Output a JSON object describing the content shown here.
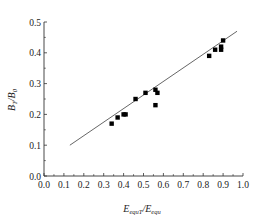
{
  "chart_data": {
    "type": "scatter",
    "title": "",
    "xlabel": "E_equT/E_equ",
    "ylabel": "B_T/B_0",
    "xlabel_parts": {
      "main": "E",
      "sub": "equT",
      "sep": "/",
      "main2": "E",
      "sub2": "equ"
    },
    "ylabel_parts": {
      "main": "B",
      "sub": "T",
      "sep": "/",
      "main2": "B",
      "sub2": "0"
    },
    "xlim": [
      0.0,
      1.0
    ],
    "ylim": [
      0.0,
      0.5
    ],
    "xticks": [
      "0.0",
      "0.1",
      "0.2",
      "0.3",
      "0.4",
      "0.5",
      "0.6",
      "0.7",
      "0.8",
      "0.9",
      "1.0"
    ],
    "yticks": [
      "0.0",
      "0.1",
      "0.2",
      "0.3",
      "0.4",
      "0.5"
    ],
    "grid": false,
    "legend": null,
    "series": [
      {
        "name": "measured",
        "marker": "square",
        "color": "#000000",
        "points": [
          [
            0.34,
            0.17
          ],
          [
            0.37,
            0.19
          ],
          [
            0.4,
            0.2
          ],
          [
            0.41,
            0.2
          ],
          [
            0.46,
            0.25
          ],
          [
            0.51,
            0.27
          ],
          [
            0.56,
            0.28
          ],
          [
            0.57,
            0.27
          ],
          [
            0.56,
            0.23
          ],
          [
            0.83,
            0.39
          ],
          [
            0.86,
            0.41
          ],
          [
            0.89,
            0.41
          ],
          [
            0.89,
            0.42
          ],
          [
            0.9,
            0.44
          ]
        ]
      },
      {
        "name": "fit line",
        "type": "line",
        "color": "#555555",
        "points": [
          [
            0.13,
            0.1
          ],
          [
            0.97,
            0.47
          ]
        ]
      }
    ]
  }
}
